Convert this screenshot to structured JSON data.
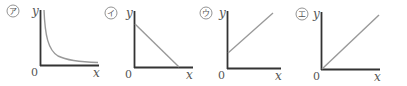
{
  "figure": {
    "panels": [
      {
        "id": "a",
        "marker": "ア",
        "y_label": "y",
        "x_label": "x",
        "origin_label": "0",
        "graph_type": "inverse proportion curve (hyperbola, decreasing, asymptotic to axes)"
      },
      {
        "id": "i",
        "marker": "イ",
        "y_label": "y",
        "x_label": "x",
        "origin_label": "0",
        "graph_type": "straight line with negative slope and positive y-intercept"
      },
      {
        "id": "u",
        "marker": "ウ",
        "y_label": "y",
        "x_label": "x",
        "origin_label": "0",
        "graph_type": "straight line with positive slope and positive y-intercept"
      },
      {
        "id": "e",
        "marker": "エ",
        "y_label": "y",
        "x_label": "x",
        "origin_label": "0",
        "graph_type": "straight line through origin with positive slope (direct proportion)"
      }
    ],
    "colors": {
      "axis": "#333333",
      "curve": "#999999",
      "text": "#555555"
    }
  }
}
